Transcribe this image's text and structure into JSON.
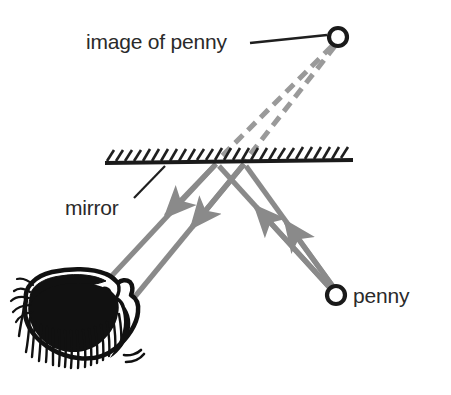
{
  "figure": {
    "background_color": "#ffffff",
    "width": 451,
    "height": 395
  },
  "colors": {
    "ink": "#2a2a2a",
    "ray_gray": "#8a8a8a",
    "dashed_gray": "#9a9a9a",
    "background": "#ffffff"
  },
  "labels": {
    "image_of_penny": "image of penny",
    "mirror": "mirror",
    "penny": "penny"
  },
  "objects": {
    "image_of_penny_marker": {
      "name": "image of penny",
      "shape": "open circle",
      "cx": 338,
      "cy": 37,
      "r": 9,
      "stroke_width": 4,
      "color": "#1a1a1a"
    },
    "penny_marker": {
      "name": "penny",
      "shape": "open circle",
      "cx": 336,
      "cy": 295,
      "r": 9,
      "stroke_width": 4,
      "color": "#1a1a1a"
    },
    "mirror_surface": {
      "name": "mirror",
      "x1": 105,
      "y1": 162,
      "x2": 353,
      "y2": 160,
      "hatch_count": 26,
      "hatch_direction": "up-right"
    },
    "observer_head": {
      "name": "observer head with hair",
      "eye_x": 118,
      "eye_y": 290
    }
  },
  "rays": {
    "incident": [
      {
        "from": "penny",
        "to": "mirror point A",
        "x1": 330,
        "y1": 288,
        "x2": 216,
        "y2": 163
      },
      {
        "from": "penny",
        "to": "mirror point B",
        "x1": 333,
        "y1": 288,
        "x2": 244,
        "y2": 163
      }
    ],
    "reflected": [
      {
        "from": "mirror point A",
        "to": "eye",
        "x1": 216,
        "y1": 163,
        "x2": 104,
        "y2": 283
      },
      {
        "from": "mirror point B",
        "to": "eye",
        "x1": 244,
        "y1": 163,
        "x2": 131,
        "y2": 299
      }
    ],
    "virtual_dashed": [
      {
        "from": "image of penny",
        "to": "mirror point A",
        "x1": 332,
        "y1": 45,
        "x2": 216,
        "y2": 163
      },
      {
        "from": "image of penny",
        "to": "mirror point B",
        "x1": 334,
        "y1": 45,
        "x2": 244,
        "y2": 163
      }
    ],
    "arrow_marker": "solid triangular arrowhead"
  },
  "leader_lines": {
    "image_of_penny": {
      "x1": 250,
      "y1": 42,
      "x2": 327,
      "y2": 36
    },
    "mirror": {
      "x1": 135,
      "y1": 196,
      "x2": 164,
      "y2": 167
    }
  },
  "icons": {
    "circle_marker_icon": "open-circle",
    "arrowhead_icon": "triangle-arrowhead",
    "hatch_icon": "diagonal-hatch"
  }
}
